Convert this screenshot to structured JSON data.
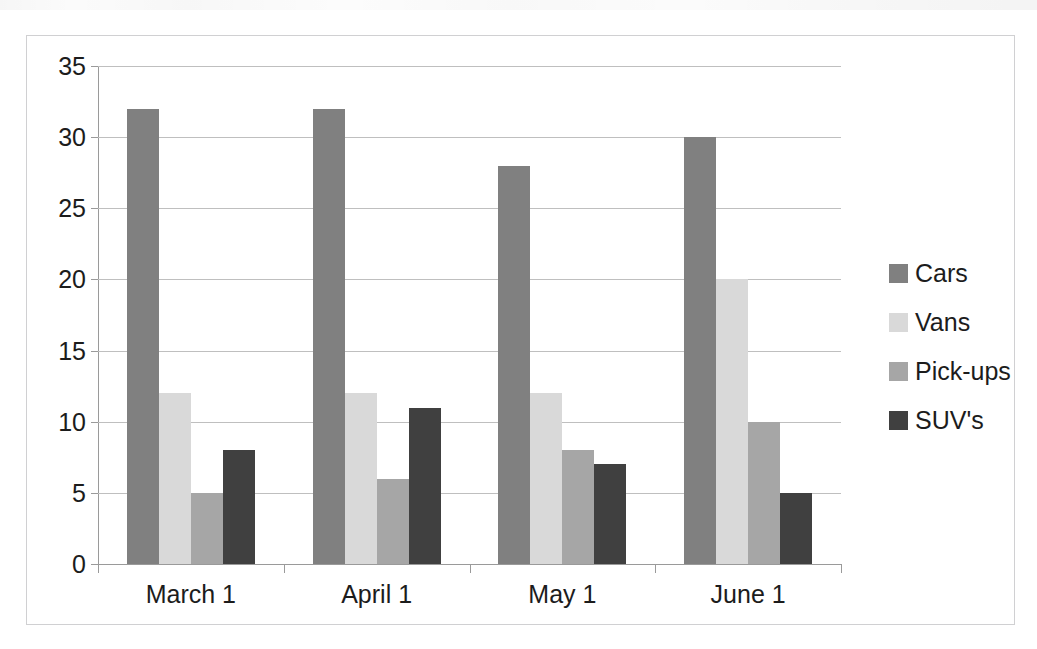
{
  "chart_data": {
    "type": "bar",
    "title": "",
    "subtitle": "",
    "xlabel": "",
    "ylabel": "",
    "categories": [
      "March 1",
      "April 1",
      "May 1",
      "June 1"
    ],
    "series": [
      {
        "name": "Cars",
        "values": [
          32,
          32,
          28,
          30
        ],
        "color": "#808080"
      },
      {
        "name": "Vans",
        "values": [
          12,
          12,
          12,
          20
        ],
        "color": "#d9d9d9"
      },
      {
        "name": "Pick-ups",
        "values": [
          5,
          6,
          8,
          10
        ],
        "color": "#a6a6a6"
      },
      {
        "name": "SUV's",
        "values": [
          8,
          11,
          7,
          5
        ],
        "color": "#404040"
      }
    ],
    "ylim": [
      0,
      35
    ],
    "ytick_labels": [
      "0",
      "5",
      "10",
      "15",
      "20",
      "25",
      "30",
      "35"
    ],
    "ytick_values": [
      0,
      5,
      10,
      15,
      20,
      25,
      30,
      35
    ],
    "grid": true,
    "grid_axis": "y",
    "legend": true,
    "legend_position": "right",
    "legend_entries": [
      "Cars",
      "Vans",
      "Pick-ups",
      "SUV's"
    ],
    "annotations": []
  },
  "style": {
    "gridline_color": "#bfbfbf",
    "axis_color": "#9a9a9a",
    "frame_color": "#d0d0d2",
    "text_color": "#1c1c1c",
    "background": "#ffffff"
  }
}
